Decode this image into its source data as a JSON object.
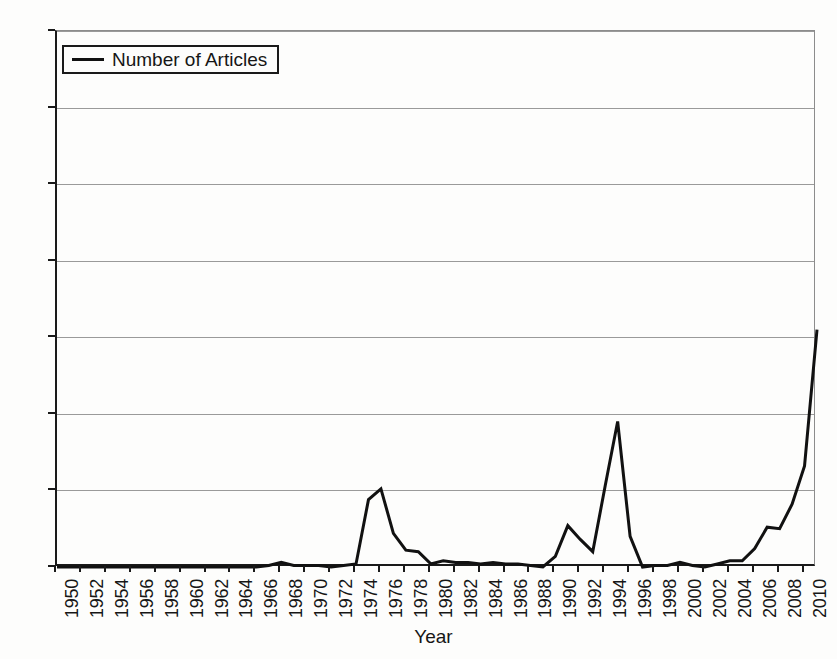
{
  "chart_data": {
    "type": "line",
    "title": "",
    "xlabel": "Year",
    "ylabel": "",
    "xlim": [
      1950,
      2011
    ],
    "ylim": [
      0,
      350
    ],
    "ytick_step": 50,
    "xtick_step": 2,
    "grid": true,
    "legend_position": "top-left",
    "legend": [
      "Number of Articles"
    ],
    "line_color": "#111111",
    "gridline_color": "#9a9a9a",
    "axis_color": "#1a1a1a",
    "background_color": "#fdfdfc",
    "yticks": [
      0,
      50,
      100,
      150,
      200,
      250,
      300,
      350
    ],
    "ytick_labels": [
      "0",
      "50",
      "100",
      "150",
      "200",
      "250",
      "300",
      "350"
    ],
    "xticks": [
      1950,
      1952,
      1954,
      1956,
      1958,
      1960,
      1962,
      1964,
      1966,
      1968,
      1970,
      1972,
      1974,
      1976,
      1978,
      1980,
      1982,
      1984,
      1986,
      1988,
      1990,
      1992,
      1994,
      1996,
      1998,
      2000,
      2002,
      2004,
      2006,
      2008,
      2010
    ],
    "xtick_labels": [
      "1950",
      "1952",
      "1954",
      "1956",
      "1958",
      "1960",
      "1962",
      "1964",
      "1966",
      "1968",
      "1970",
      "1972",
      "1974",
      "1976",
      "1978",
      "1980",
      "1982",
      "1984",
      "1986",
      "1988",
      "1990",
      "1992",
      "1994",
      "1996",
      "1998",
      "2000",
      "2002",
      "2004",
      "2006",
      "2008",
      "2010"
    ],
    "series": [
      {
        "name": "Number of Articles",
        "x": [
          1950,
          1951,
          1952,
          1953,
          1954,
          1955,
          1956,
          1957,
          1958,
          1959,
          1960,
          1961,
          1962,
          1963,
          1964,
          1965,
          1966,
          1967,
          1968,
          1969,
          1970,
          1971,
          1972,
          1973,
          1974,
          1975,
          1976,
          1977,
          1978,
          1979,
          1980,
          1981,
          1982,
          1983,
          1984,
          1985,
          1986,
          1987,
          1988,
          1989,
          1990,
          1991,
          1992,
          1993,
          1994,
          1995,
          1996,
          1997,
          1998,
          1999,
          2000,
          2001,
          2002,
          2003,
          2004,
          2005,
          2006,
          2007,
          2008,
          2009,
          2010,
          2011
        ],
        "values": [
          0,
          0,
          0,
          0,
          0,
          0,
          0,
          0,
          0,
          0,
          0,
          0,
          0,
          0,
          0,
          0,
          0,
          1,
          3,
          1,
          1,
          1,
          0,
          1,
          2,
          44,
          51,
          22,
          11,
          10,
          2,
          4,
          3,
          3,
          2,
          3,
          2,
          2,
          1,
          0,
          7,
          27,
          18,
          10,
          53,
          95,
          20,
          0,
          1,
          1,
          3,
          1,
          0,
          2,
          4,
          4,
          12,
          26,
          25,
          41,
          66,
          155
        ]
      }
    ]
  },
  "legend": {
    "label": "Number of Articles"
  },
  "axis": {
    "x_title": "Year"
  }
}
